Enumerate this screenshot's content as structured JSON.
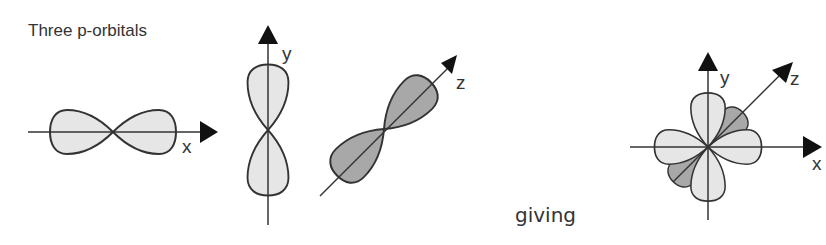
{
  "title": "Three p-orbitals",
  "connector_text": "giving",
  "colors": {
    "light_lobe": "#e6e6e6",
    "dark_lobe": "#a8a8a8",
    "stroke": "#333333"
  },
  "orbitals": [
    {
      "name": "p-x",
      "axis_label": "x",
      "fill": "light"
    },
    {
      "name": "p-y",
      "axis_label": "y",
      "fill": "light"
    },
    {
      "name": "p-z",
      "axis_label": "z",
      "fill": "dark"
    }
  ],
  "combined": {
    "axis_labels": {
      "x": "x",
      "y": "y",
      "z": "z"
    }
  }
}
